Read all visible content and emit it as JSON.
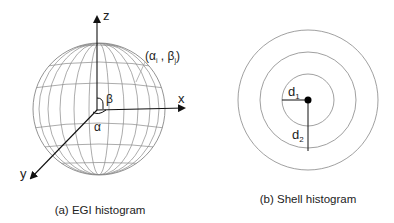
{
  "figure_a": {
    "caption": "(a) EGI histogram",
    "axes": {
      "x": "x",
      "y": "y",
      "z": "z"
    },
    "angles": {
      "alpha": "α",
      "beta": "β"
    },
    "bin_label": "(αi , βj)",
    "bin_label_parts": {
      "open": "(α",
      "i": "i",
      "sep": " , β",
      "j": "j",
      "close": ")"
    }
  },
  "figure_b": {
    "caption": "(b) Shell histogram",
    "radii_labels": {
      "d1": "d",
      "d1_sub": "1",
      "d2": "d",
      "d2_sub": "2"
    }
  },
  "colors": {
    "line": "#222222",
    "grid": "#777777"
  }
}
